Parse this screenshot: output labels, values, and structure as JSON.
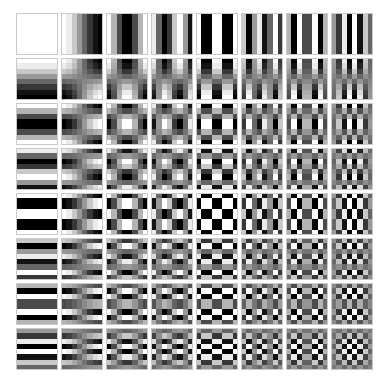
{
  "figure": {
    "background_color": "#ffffff",
    "tile_border_color": "#c9c9c9",
    "canvas_width": 381,
    "canvas_height": 390
  },
  "layout": {
    "rows": 8,
    "cols": 8,
    "grid_left": 16,
    "grid_top": 13,
    "tile_size": 42,
    "tile_gap": 3,
    "block_pixels": 8
  },
  "chart_data": {
    "type": "heatmap",
    "xlabel": "horizontal frequency u",
    "ylabel": "vertical frequency v",
    "grid": false,
    "legend": "none",
    "colormap": "gray",
    "vmin": -1,
    "vmax": 1,
    "black_hex": "#000000",
    "white_hex": "#ffffff",
    "mid_gray_hex": "#808080",
    "u_values": [
      0,
      1,
      2,
      3,
      4,
      5,
      6,
      7
    ],
    "v_values": [
      0,
      1,
      2,
      3,
      4,
      5,
      6,
      7
    ],
    "formula": "B(v,u)[y,x] = cos((2x+1)*u*pi/16) * cos((2y+1)*v*pi/16)",
    "tiles": [
      {
        "v": 0,
        "u": 0,
        "label": "v0u0",
        "appearance": "solid white (DC)"
      },
      {
        "v": 0,
        "u": 1,
        "label": "v0u1",
        "appearance": "horizontal gradient white to black"
      },
      {
        "v": 0,
        "u": 2,
        "label": "v0u2",
        "appearance": "1 vertical stripe cycle"
      },
      {
        "v": 0,
        "u": 3,
        "label": "v0u3",
        "appearance": "1.5 vertical stripe cycles"
      },
      {
        "v": 0,
        "u": 4,
        "label": "v0u4",
        "appearance": "2 vertical stripe cycles"
      },
      {
        "v": 0,
        "u": 5,
        "label": "v0u5",
        "appearance": "2.5 vertical stripe cycles"
      },
      {
        "v": 0,
        "u": 6,
        "label": "v0u6",
        "appearance": "3 vertical stripe cycles"
      },
      {
        "v": 0,
        "u": 7,
        "label": "v0u7",
        "appearance": "3.5 vertical stripe cycles"
      },
      {
        "v": 1,
        "u": 0,
        "label": "v1u0",
        "appearance": "vertical gradient white to black"
      },
      {
        "v": 1,
        "u": 1,
        "label": "v1u1",
        "appearance": "diagonal 2x2 blob"
      },
      {
        "v": 1,
        "u": 2,
        "label": "v1u2",
        "appearance": "2x1 coarse checker"
      },
      {
        "v": 1,
        "u": 3,
        "label": "v1u3",
        "appearance": "3x1 coarse checker"
      },
      {
        "v": 1,
        "u": 4,
        "label": "v1u4",
        "appearance": "4x1 coarse checker"
      },
      {
        "v": 1,
        "u": 5,
        "label": "v1u5",
        "appearance": "5x1 coarse checker"
      },
      {
        "v": 1,
        "u": 6,
        "label": "v1u6",
        "appearance": "6x1 coarse checker"
      },
      {
        "v": 1,
        "u": 7,
        "label": "v1u7",
        "appearance": "7x1 coarse checker"
      },
      {
        "v": 2,
        "u": 0,
        "label": "v2u0",
        "appearance": "1 horizontal stripe cycle"
      },
      {
        "v": 2,
        "u": 1,
        "label": "v2u1",
        "appearance": "1x2 checker"
      },
      {
        "v": 2,
        "u": 2,
        "label": "v2u2",
        "appearance": "2x2 checker"
      },
      {
        "v": 2,
        "u": 3,
        "label": "v2u3",
        "appearance": "3x2 checker"
      },
      {
        "v": 2,
        "u": 4,
        "label": "v2u4",
        "appearance": "4x2 checker"
      },
      {
        "v": 2,
        "u": 5,
        "label": "v2u5",
        "appearance": "5x2 checker"
      },
      {
        "v": 2,
        "u": 6,
        "label": "v2u6",
        "appearance": "6x2 checker"
      },
      {
        "v": 2,
        "u": 7,
        "label": "v2u7",
        "appearance": "7x2 checker"
      },
      {
        "v": 3,
        "u": 0,
        "label": "v3u0",
        "appearance": "1.5 horizontal stripe cycles"
      },
      {
        "v": 3,
        "u": 1,
        "label": "v3u1",
        "appearance": "1x3 checker"
      },
      {
        "v": 3,
        "u": 2,
        "label": "v3u2",
        "appearance": "2x3 checker"
      },
      {
        "v": 3,
        "u": 3,
        "label": "v3u3",
        "appearance": "3x3 checker"
      },
      {
        "v": 3,
        "u": 4,
        "label": "v3u4",
        "appearance": "4x3 checker"
      },
      {
        "v": 3,
        "u": 5,
        "label": "v3u5",
        "appearance": "5x3 checker"
      },
      {
        "v": 3,
        "u": 6,
        "label": "v3u6",
        "appearance": "6x3 checker"
      },
      {
        "v": 3,
        "u": 7,
        "label": "v3u7",
        "appearance": "7x3 checker"
      },
      {
        "v": 4,
        "u": 0,
        "label": "v4u0",
        "appearance": "2 horizontal stripe cycles"
      },
      {
        "v": 4,
        "u": 1,
        "label": "v4u1",
        "appearance": "1x4 checker"
      },
      {
        "v": 4,
        "u": 2,
        "label": "v4u2",
        "appearance": "2x4 checker"
      },
      {
        "v": 4,
        "u": 3,
        "label": "v4u3",
        "appearance": "3x4 checker"
      },
      {
        "v": 4,
        "u": 4,
        "label": "v4u4",
        "appearance": "4x4 checker"
      },
      {
        "v": 4,
        "u": 5,
        "label": "v4u5",
        "appearance": "5x4 checker"
      },
      {
        "v": 4,
        "u": 6,
        "label": "v4u6",
        "appearance": "6x4 checker"
      },
      {
        "v": 4,
        "u": 7,
        "label": "v4u7",
        "appearance": "7x4 checker"
      },
      {
        "v": 5,
        "u": 0,
        "label": "v5u0",
        "appearance": "2.5 horizontal stripe cycles"
      },
      {
        "v": 5,
        "u": 1,
        "label": "v5u1",
        "appearance": "1x5 checker"
      },
      {
        "v": 5,
        "u": 2,
        "label": "v5u2",
        "appearance": "2x5 checker"
      },
      {
        "v": 5,
        "u": 3,
        "label": "v5u3",
        "appearance": "3x5 checker"
      },
      {
        "v": 5,
        "u": 4,
        "label": "v5u4",
        "appearance": "4x5 checker"
      },
      {
        "v": 5,
        "u": 5,
        "label": "v5u5",
        "appearance": "5x5 checker"
      },
      {
        "v": 5,
        "u": 6,
        "label": "v5u6",
        "appearance": "6x5 checker"
      },
      {
        "v": 5,
        "u": 7,
        "label": "v5u7",
        "appearance": "7x5 checker"
      },
      {
        "v": 6,
        "u": 0,
        "label": "v6u0",
        "appearance": "3 horizontal stripe cycles"
      },
      {
        "v": 6,
        "u": 1,
        "label": "v6u1",
        "appearance": "1x6 checker"
      },
      {
        "v": 6,
        "u": 2,
        "label": "v6u2",
        "appearance": "2x6 checker"
      },
      {
        "v": 6,
        "u": 3,
        "label": "v6u3",
        "appearance": "3x6 checker"
      },
      {
        "v": 6,
        "u": 4,
        "label": "v6u4",
        "appearance": "4x6 checker"
      },
      {
        "v": 6,
        "u": 5,
        "label": "v6u5",
        "appearance": "5x6 checker"
      },
      {
        "v": 6,
        "u": 6,
        "label": "v6u6",
        "appearance": "6x6 checker"
      },
      {
        "v": 6,
        "u": 7,
        "label": "v6u7",
        "appearance": "7x6 checker"
      },
      {
        "v": 7,
        "u": 0,
        "label": "v7u0",
        "appearance": "3.5 horizontal stripe cycles"
      },
      {
        "v": 7,
        "u": 1,
        "label": "v7u1",
        "appearance": "1x7 checker"
      },
      {
        "v": 7,
        "u": 2,
        "label": "v7u2",
        "appearance": "2x7 checker"
      },
      {
        "v": 7,
        "u": 3,
        "label": "v7u3",
        "appearance": "3x7 checker"
      },
      {
        "v": 7,
        "u": 4,
        "label": "v7u4",
        "appearance": "4x7 checker"
      },
      {
        "v": 7,
        "u": 5,
        "label": "v7u5",
        "appearance": "5x7 checker"
      },
      {
        "v": 7,
        "u": 6,
        "label": "v7u6",
        "appearance": "6x7 checker"
      },
      {
        "v": 7,
        "u": 7,
        "label": "v7u7",
        "appearance": "finest 7x7 checker"
      }
    ]
  }
}
